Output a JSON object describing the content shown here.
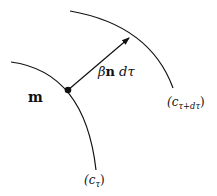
{
  "labels": {
    "point": "m",
    "vector_beta": "β",
    "vector_n": "n",
    "vector_d": " d",
    "vector_tau": "τ",
    "curve_outer_open": "(c",
    "curve_outer_sub": "τ+dτ",
    "curve_outer_close": ")",
    "curve_inner_open": "(c",
    "curve_inner_sub": "τ",
    "curve_inner_close": ")"
  },
  "colors": {
    "stroke": "#111111",
    "background": "#ffffff"
  }
}
